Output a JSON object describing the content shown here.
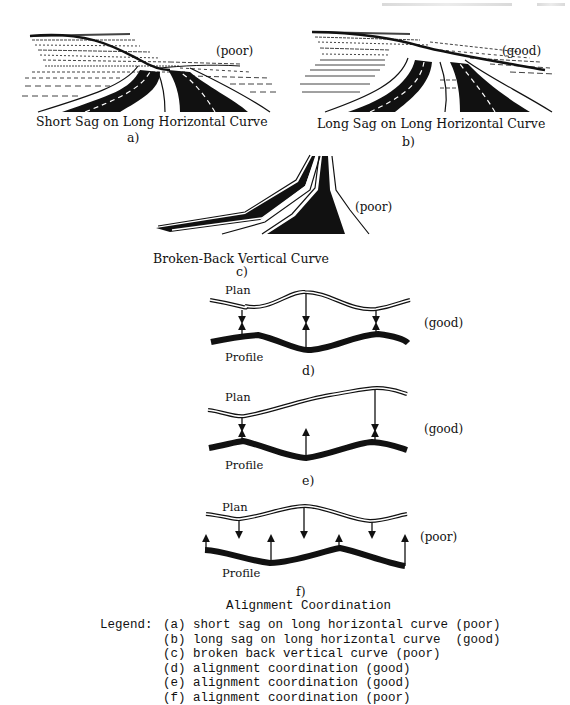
{
  "header": {
    "running_head": "",
    "page_number": ""
  },
  "figures": {
    "a": {
      "rating": "(poor)",
      "title": "Short Sag on Long Horizontal Curve",
      "letter": "a)"
    },
    "b": {
      "rating": "(good)",
      "title": "Long Sag on Long Horizontal Curve",
      "letter": "b)"
    },
    "c": {
      "rating": "(poor)",
      "title": "Broken-Back Vertical Curve",
      "letter": "c)"
    },
    "d": {
      "plan_label": "Plan",
      "profile_label": "Profile",
      "rating": "(good)",
      "letter": "d)"
    },
    "e": {
      "plan_label": "Plan",
      "profile_label": "Profile",
      "rating": "(good)",
      "letter": "e)"
    },
    "f": {
      "plan_label": "Plan",
      "profile_label": "Profile",
      "rating": "(poor)",
      "letter": "f)"
    }
  },
  "figure_title": "Alignment Coordination",
  "legend": {
    "title": "Legend:",
    "items": [
      {
        "key": "(a)",
        "text": "short sag on long horizontal curve (poor)"
      },
      {
        "key": "(b)",
        "text": "long sag on long horizontal curve  (good)"
      },
      {
        "key": "(c)",
        "text": "broken back vertical curve (poor)"
      },
      {
        "key": "(d)",
        "text": "alignment coordination (good)"
      },
      {
        "key": "(e)",
        "text": "alignment coordination (good)"
      },
      {
        "key": "(f)",
        "text": "alignment coordination (poor)"
      }
    ]
  }
}
